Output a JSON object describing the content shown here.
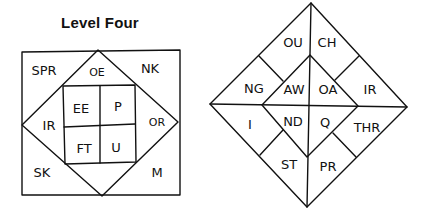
{
  "left_diagram": {
    "title": "Level Four",
    "labels": {
      "spr": "SPR",
      "nk": "NK",
      "oe": "OE",
      "ir": "IR",
      "or": "OR",
      "sk": "SK",
      "m": "M",
      "ee": "EE",
      "p": "P",
      "ft": "FT",
      "u": "U"
    }
  },
  "right_diagram": {
    "labels": {
      "ou": "OU",
      "ch": "CH",
      "ng": "NG",
      "aw": "AW",
      "oa": "OA",
      "ir": "IR",
      "i": "I",
      "nd": "ND",
      "q": "Q",
      "thr": "THR",
      "st": "ST",
      "pr": "PR"
    }
  },
  "colors": {
    "line": "#111111",
    "background": "#ffffff"
  }
}
